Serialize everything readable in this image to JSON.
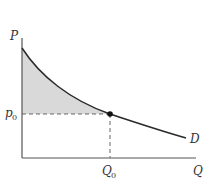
{
  "diagram": {
    "type": "demand-curve-consumer-surplus",
    "axes": {
      "y_label": "P",
      "x_label": "Q"
    },
    "curve_label": "D",
    "price_label": "p",
    "price_sub": "0",
    "quantity_label": "Q",
    "quantity_sub": "0",
    "colors": {
      "axis": "#555555",
      "curve": "#2a2a2a",
      "shade": "#d9d9d9",
      "dash": "#666666",
      "point": "#111111"
    }
  }
}
